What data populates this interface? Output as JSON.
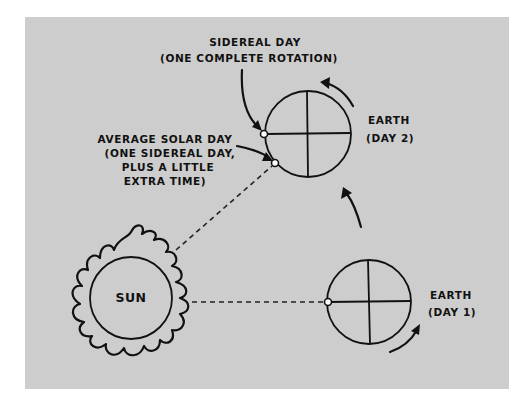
{
  "diagram": {
    "colors": {
      "background": "#ffffff",
      "panel": "#cdcdcd",
      "ink": "#111111"
    },
    "labels": {
      "sidereal_line1": "SIDEREAL DAY",
      "sidereal_line2": "(ONE COMPLETE ROTATION)",
      "solar_line1": "AVERAGE SOLAR DAY",
      "solar_line2": "(ONE SIDEREAL DAY,",
      "solar_line3": "PLUS A LITTLE",
      "solar_line4": "EXTRA TIME)",
      "earth2_line1": "EARTH",
      "earth2_line2": "(DAY 2)",
      "earth1_line1": "EARTH",
      "earth1_line2": "(DAY 1)",
      "sun": "SUN"
    },
    "nodes": [
      {
        "id": "sun",
        "label": "SUN",
        "cx": 131,
        "cy": 298,
        "r": 41
      },
      {
        "id": "earth-day1",
        "label": "EARTH (DAY 1)",
        "cx": 369,
        "cy": 302,
        "r": 42
      },
      {
        "id": "earth-day2",
        "label": "EARTH (DAY 2)",
        "cx": 308,
        "cy": 134,
        "r": 43
      }
    ],
    "connections": [
      {
        "from": "sun",
        "to": "earth-day1",
        "style": "dashed"
      },
      {
        "from": "sun",
        "to": "earth-day2",
        "style": "dashed"
      }
    ],
    "arrows": [
      "rotation arrow at earth day 1",
      "orbit arrow from day 1 to day 2",
      "rotation arrow at earth day 2",
      "sidereal day pointer",
      "average solar day pointer"
    ]
  }
}
